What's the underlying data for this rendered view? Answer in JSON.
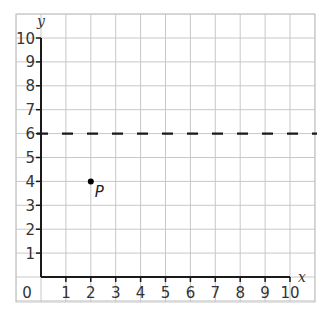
{
  "chart_data": {
    "type": "scatter",
    "title": "",
    "xlabel": "x",
    "ylabel": "y",
    "xlim": [
      0,
      10
    ],
    "ylim": [
      0,
      10
    ],
    "x_ticks": [
      0,
      1,
      2,
      3,
      4,
      5,
      6,
      7,
      8,
      9,
      10
    ],
    "y_ticks": [
      1,
      2,
      3,
      4,
      5,
      6,
      7,
      8,
      9,
      10
    ],
    "grid": true,
    "points": [
      {
        "label": "P",
        "x": 2,
        "y": 4
      }
    ],
    "lines": [
      {
        "type": "horizontal",
        "style": "dashed",
        "y": 6,
        "equation": "y = 6"
      }
    ]
  },
  "colors": {
    "grid": "#c8c8c8",
    "axis": "#1a1a1a",
    "dashed_line": "#1a1a1a",
    "point": "#000000",
    "text": "#333333"
  }
}
